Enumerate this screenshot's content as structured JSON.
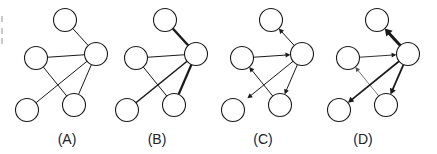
{
  "figure": {
    "stroke_color": "#1a1a1a",
    "node_fill": "#ffffff",
    "node_radius": 11.5
  },
  "nodes_template": [
    {
      "id": "top",
      "x": 65,
      "y": 20
    },
    {
      "id": "hub",
      "x": 96,
      "y": 54
    },
    {
      "id": "left",
      "x": 36,
      "y": 58
    },
    {
      "id": "bottom_right",
      "x": 74,
      "y": 105
    },
    {
      "id": "bottom_left",
      "x": 27,
      "y": 110
    }
  ],
  "panels": [
    {
      "label": "(A)",
      "offset_x": 0,
      "label_x": 47,
      "edges": [
        {
          "from": "top",
          "to": "hub",
          "width": 1,
          "arrow": "none"
        },
        {
          "from": "left",
          "to": "hub",
          "width": 1,
          "arrow": "none"
        },
        {
          "from": "left",
          "to": "bottom_right",
          "width": 1,
          "arrow": "none"
        },
        {
          "from": "hub",
          "to": "bottom_left",
          "width": 1,
          "arrow": "none"
        },
        {
          "from": "hub",
          "to": "bottom_right",
          "width": 1,
          "arrow": "none"
        }
      ]
    },
    {
      "label": "(B)",
      "offset_x": 100,
      "label_x": 137,
      "edges": [
        {
          "from": "top",
          "to": "hub",
          "width": 2.4,
          "arrow": "none"
        },
        {
          "from": "left",
          "to": "hub",
          "width": 1,
          "arrow": "none"
        },
        {
          "from": "left",
          "to": "bottom_right",
          "width": 1,
          "arrow": "none"
        },
        {
          "from": "hub",
          "to": "bottom_left",
          "width": 1.6,
          "arrow": "none"
        },
        {
          "from": "hub",
          "to": "bottom_right",
          "width": 2.2,
          "arrow": "none"
        }
      ]
    },
    {
      "label": "(C)",
      "offset_x": 206,
      "label_x": 243,
      "edges": [
        {
          "from": "hub",
          "to": "top",
          "width": 1,
          "arrow": "end"
        },
        {
          "from": "left",
          "to": "hub",
          "width": 1,
          "arrow": "end"
        },
        {
          "from": "bottom_right",
          "to": "left",
          "width": 1,
          "arrow": "end"
        },
        {
          "from": "hub",
          "to": "bottom_left",
          "width": 1,
          "arrow": "end",
          "short": true
        },
        {
          "from": "hub",
          "to": "bottom_right",
          "width": 1,
          "arrow": "end"
        }
      ]
    },
    {
      "label": "(D)",
      "offset_x": 312,
      "label_x": 343,
      "edges": [
        {
          "from": "hub",
          "to": "top",
          "width": 3,
          "arrow": "end"
        },
        {
          "from": "left",
          "to": "hub",
          "width": 0.9,
          "arrow": "end"
        },
        {
          "from": "bottom_right",
          "to": "left",
          "width": 0.8,
          "arrow": "end",
          "color": "#555555"
        },
        {
          "from": "hub",
          "to": "bottom_left",
          "width": 1.7,
          "arrow": "end"
        },
        {
          "from": "hub",
          "to": "bottom_right",
          "width": 1.8,
          "arrow": "end"
        }
      ]
    }
  ]
}
